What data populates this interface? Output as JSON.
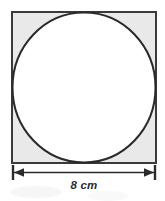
{
  "figure": {
    "background_color": "#ffffff",
    "square": {
      "label": "square",
      "fill_color": "#e9e9e9",
      "stroke_color": "#3a3a3a",
      "stroke_width": 2,
      "x": 11,
      "y": 11,
      "width": 145,
      "height": 152,
      "side_length_value": 8,
      "side_length_unit": "cm"
    },
    "circle": {
      "label": "inscribed-circle",
      "fill_color": "#ffffff",
      "stroke_color": "#2a2a2a",
      "stroke_width": 2,
      "center_x": 83.5,
      "center_y": 87,
      "radius_x": 72,
      "radius_y": 76,
      "tangent_to": "all four sides of the square"
    },
    "shaded_region": {
      "label": "corner-region-between-square-and-circle",
      "color": "#e9e9e9"
    },
    "dimension": {
      "label": "8 cm",
      "value": "8",
      "unit": "cm",
      "line_color": "#2b2b2b",
      "y": 172,
      "x_start": 12,
      "x_end": 155,
      "arrow_left": "left-arrowhead",
      "arrow_right": "right-arrowhead",
      "tick_left": "extension-tick-left",
      "tick_right": "extension-tick-right"
    }
  }
}
